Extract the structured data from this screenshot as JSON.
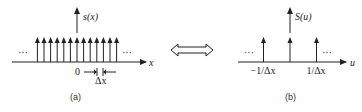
{
  "panel_a": {
    "function_label": "s(x)",
    "axis_label": "x",
    "origin_label": "0",
    "spacing_label": "Δx",
    "caption": "(a)",
    "ellipsis": "···",
    "impulse_count": 13
  },
  "transform_symbol": "⟺",
  "panel_b": {
    "function_label": "S(u)",
    "axis_label": "u",
    "left_tick_label": "−1/Δx",
    "right_tick_label": "1/Δx",
    "caption": "(b)",
    "ellipsis": "···",
    "impulse_count": 3
  }
}
